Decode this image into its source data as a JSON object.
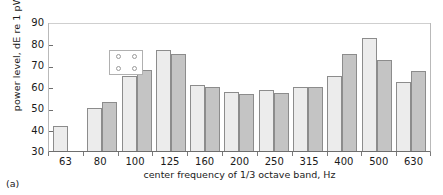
{
  "caption": "(a)",
  "legend": {
    "marks": [
      "circle-1",
      "circle-2",
      "circle-3",
      "circle-4"
    ]
  },
  "chart_data": {
    "type": "bar",
    "title": "",
    "xlabel": "center frequency of 1/3 octave band, Hz",
    "ylabel": "power level, dE re 1 pW",
    "categories": [
      "63",
      "80",
      "100",
      "125",
      "160",
      "200",
      "250",
      "315",
      "400",
      "500",
      "630"
    ],
    "series": [
      {
        "name": "series-1",
        "color": "#ececec",
        "values": [
          41.5,
          50.0,
          65.0,
          77.0,
          60.5,
          57.5,
          58.5,
          60.0,
          65.0,
          82.5,
          62.0
        ]
      },
      {
        "name": "series-2",
        "color": "#c4c4c4",
        "values": [
          null,
          53.0,
          67.5,
          75.0,
          60.0,
          56.5,
          57.0,
          60.0,
          75.0,
          72.5,
          67.0
        ]
      }
    ],
    "ylim": [
      30,
      90
    ],
    "yticks": [
      30,
      40,
      50,
      60,
      70,
      80,
      90
    ],
    "ytick_labels": [
      "30",
      "40",
      "50",
      "60",
      "70",
      "80",
      "90"
    ],
    "grid": false,
    "legend_position": "upper-left"
  }
}
